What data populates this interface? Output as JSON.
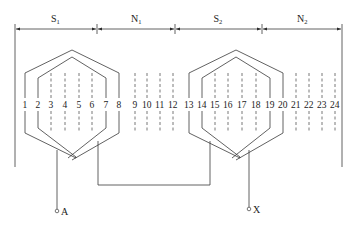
{
  "diagram": {
    "title": "",
    "pole_sections": [
      {
        "label": "S",
        "sub": "1",
        "x_start": 15,
        "x_end": 97
      },
      {
        "label": "N",
        "sub": "1",
        "x_start": 97,
        "x_end": 175
      },
      {
        "label": "S",
        "sub": "2",
        "x_start": 175,
        "x_end": 262
      },
      {
        "label": "N",
        "sub": "2",
        "x_start": 262,
        "x_end": 342
      }
    ],
    "slots": [
      {
        "n": "1",
        "x": 25,
        "coil": true
      },
      {
        "n": "2",
        "x": 38,
        "coil": true
      },
      {
        "n": "3",
        "x": 51,
        "coil": false
      },
      {
        "n": "4",
        "x": 65,
        "coil": false
      },
      {
        "n": "5",
        "x": 79,
        "coil": false
      },
      {
        "n": "6",
        "x": 92,
        "coil": false
      },
      {
        "n": "7",
        "x": 106,
        "coil": true
      },
      {
        "n": "8",
        "x": 119,
        "coil": true
      },
      {
        "n": "9",
        "x": 135,
        "coil": false
      },
      {
        "n": "10",
        "x": 147,
        "coil": false
      },
      {
        "n": "11",
        "x": 160,
        "coil": false
      },
      {
        "n": "12",
        "x": 173,
        "coil": false
      },
      {
        "n": "13",
        "x": 189,
        "coil": true
      },
      {
        "n": "14",
        "x": 202,
        "coil": true
      },
      {
        "n": "15",
        "x": 215,
        "coil": false
      },
      {
        "n": "16",
        "x": 228,
        "coil": false
      },
      {
        "n": "17",
        "x": 242,
        "coil": false
      },
      {
        "n": "18",
        "x": 256,
        "coil": false
      },
      {
        "n": "19",
        "x": 270,
        "coil": true
      },
      {
        "n": "20",
        "x": 283,
        "coil": true
      },
      {
        "n": "21",
        "x": 296,
        "coil": false
      },
      {
        "n": "22",
        "x": 309,
        "coil": false
      },
      {
        "n": "23",
        "x": 322,
        "coil": false
      },
      {
        "n": "24",
        "x": 335,
        "coil": false
      }
    ],
    "coils": [
      {
        "name": "coil-group-1",
        "outer_left": 25,
        "outer_right": 119,
        "inner_left": 38,
        "inner_right": 106
      },
      {
        "name": "coil-group-2",
        "outer_left": 189,
        "outer_right": 283,
        "inner_left": 202,
        "inner_right": 270
      }
    ],
    "terminals": [
      {
        "label": "A",
        "x": 57,
        "y": 211
      },
      {
        "label": "X",
        "x": 249,
        "y": 209
      }
    ],
    "colors": {
      "line": "#3a3a3a",
      "text": "#222222",
      "background": "#ffffff"
    }
  }
}
